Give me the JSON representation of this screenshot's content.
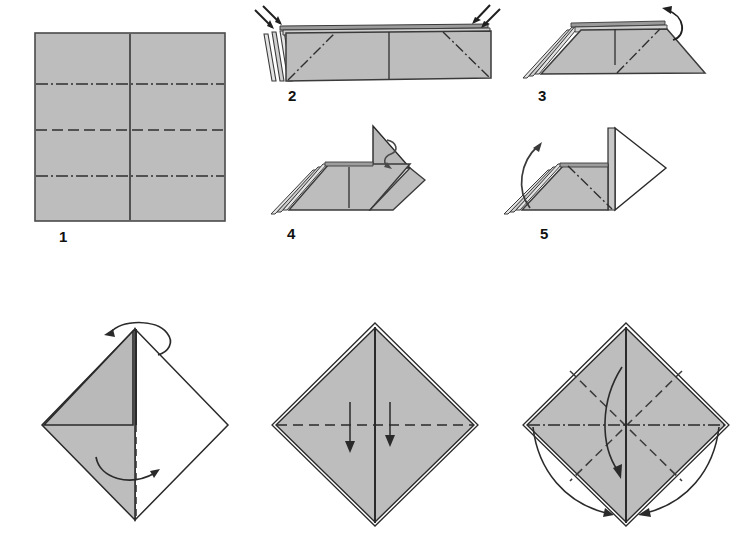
{
  "document": {
    "title": "Origami Folding Diagram",
    "type": "instructional-diagram",
    "background_color": "#ffffff",
    "paper_front_color": "#bdbdbd",
    "paper_back_color": "#ffffff",
    "line_color": "#2a2a2a",
    "crease_color": "#3a3a3a",
    "total_steps": 8
  },
  "steps": [
    {
      "number": "1",
      "label": "1",
      "description": "Flat square sheet with pre-creased horizontal quarter lines and vertical centre line",
      "shape": "square",
      "creases": [
        {
          "kind": "mountain-dash-dot",
          "orientation": "horizontal",
          "position": "upper-quarter"
        },
        {
          "kind": "valley-dashed",
          "orientation": "horizontal",
          "position": "centre"
        },
        {
          "kind": "mountain-dash-dot",
          "orientation": "horizontal",
          "position": "lower-quarter"
        },
        {
          "kind": "solid-edge",
          "orientation": "vertical",
          "position": "centre"
        }
      ],
      "arrows": []
    },
    {
      "number": "2",
      "label": "2",
      "description": "Accordion-pleated strip seen edge-on, with diagonal fold lines at both ends",
      "shape": "pleated-strip",
      "creases": [
        {
          "kind": "mountain-dash-dot",
          "orientation": "diagonal",
          "position": "left-end"
        },
        {
          "kind": "mountain-dash-dot",
          "orientation": "diagonal",
          "position": "right-end"
        },
        {
          "kind": "solid-edge",
          "orientation": "vertical",
          "position": "centre"
        }
      ],
      "arrows": [
        {
          "kind": "straight-pair",
          "direction": "down-right",
          "position": "top-left"
        },
        {
          "kind": "straight-pair",
          "direction": "down-left",
          "position": "top-right"
        }
      ]
    },
    {
      "number": "3",
      "label": "3",
      "description": "Ends folded down to form a trapezoid; right corner being lifted",
      "shape": "trapezoid",
      "creases": [
        {
          "kind": "mountain-dash-dot",
          "orientation": "diagonal",
          "position": "right"
        },
        {
          "kind": "solid-edge",
          "orientation": "vertical",
          "position": "centre"
        }
      ],
      "arrows": [
        {
          "kind": "curved",
          "direction": "counter-clockwise-up",
          "position": "top-right"
        }
      ]
    },
    {
      "number": "4",
      "label": "4",
      "description": "Right end swung up into a standing triangular flap",
      "shape": "flap-up",
      "creases": [
        {
          "kind": "solid-edge",
          "orientation": "vertical",
          "position": "centre"
        }
      ],
      "arrows": [
        {
          "kind": "loop-twist",
          "direction": "clockwise",
          "position": "flap-top"
        }
      ]
    },
    {
      "number": "5",
      "label": "5",
      "description": "Flap opened to reveal the white reverse side; left pleats about to be raised",
      "shape": "flap-open",
      "creases": [
        {
          "kind": "mountain-dash-dot",
          "orientation": "diagonal",
          "position": "body"
        }
      ],
      "arrows": [
        {
          "kind": "curved",
          "direction": "up-left",
          "position": "left"
        }
      ]
    },
    {
      "number": "6",
      "label": "6",
      "description": "Diamond form, left half grey and right half white; turn the near flap over",
      "shape": "diamond-half",
      "creases": [
        {
          "kind": "valley-dashed",
          "orientation": "vertical",
          "position": "lower-centre"
        },
        {
          "kind": "solid-edge",
          "orientation": "horizontal",
          "position": "middle-left"
        }
      ],
      "arrows": [
        {
          "kind": "rotate-loop",
          "direction": "over-the-top",
          "position": "top-vertex"
        },
        {
          "kind": "curved",
          "direction": "sweep-right",
          "position": "lower-centre"
        }
      ]
    },
    {
      "number": "7",
      "label": "7",
      "description": "Completed diamond; fold the two upper flaps downward",
      "shape": "diamond-full",
      "creases": [
        {
          "kind": "valley-dashed",
          "orientation": "horizontal",
          "position": "centre"
        },
        {
          "kind": "solid-edge",
          "orientation": "vertical",
          "position": "centre"
        }
      ],
      "arrows": [
        {
          "kind": "straight",
          "direction": "down",
          "position": "left-of-centre"
        },
        {
          "kind": "straight",
          "direction": "down",
          "position": "right-of-centre"
        }
      ]
    },
    {
      "number": "8",
      "label": "8",
      "description": "Diamond with diagonal valley creases and horizontal mountain crease; fold edges to the bottom point",
      "shape": "diamond-creased",
      "creases": [
        {
          "kind": "mountain-dash-dot",
          "orientation": "horizontal",
          "position": "centre"
        },
        {
          "kind": "valley-dashed",
          "orientation": "diagonal",
          "position": "upper-left-to-lower-right"
        },
        {
          "kind": "valley-dashed",
          "orientation": "diagonal",
          "position": "upper-right-to-lower-left"
        },
        {
          "kind": "solid-edge",
          "orientation": "vertical",
          "position": "centre"
        }
      ],
      "arrows": [
        {
          "kind": "curved",
          "direction": "down-to-point",
          "position": "centre"
        },
        {
          "kind": "curved",
          "direction": "down-to-point",
          "position": "right"
        }
      ]
    }
  ]
}
